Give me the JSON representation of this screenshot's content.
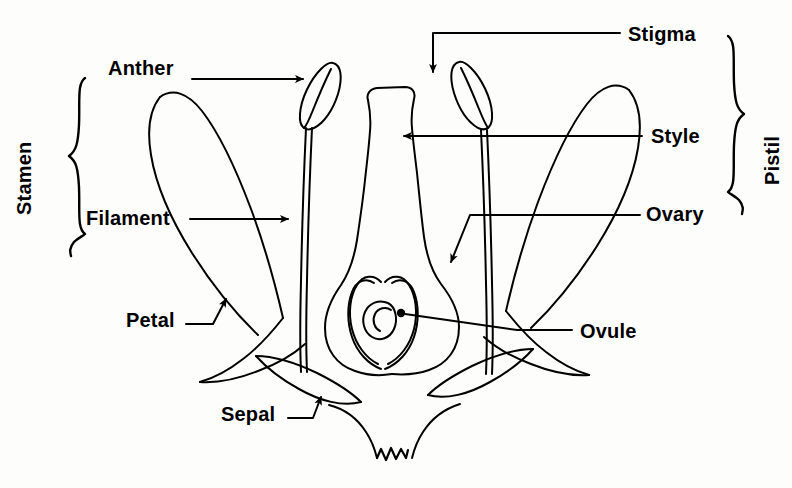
{
  "figure": {
    "kind": "botanical-diagram",
    "background_color": "#fdfdfc",
    "ink_color": "#000000",
    "width": 792,
    "height": 488
  },
  "labels": {
    "stamen": "Stamen",
    "pistil": "Pistil",
    "anther": "Anther",
    "filament": "Filament",
    "petal": "Petal",
    "sepal": "Sepal",
    "stigma": "Stigma",
    "style": "Style",
    "ovary": "Ovary",
    "ovule": "Ovule"
  },
  "groups": [
    {
      "name": "Stamen",
      "side": "left",
      "parts": [
        "Anther",
        "Filament"
      ]
    },
    {
      "name": "Pistil",
      "side": "right",
      "parts": [
        "Stigma",
        "Style",
        "Ovary"
      ]
    }
  ],
  "callouts": [
    {
      "label": "Anther",
      "side": "left",
      "leader": "straight-arrow",
      "points_to": "anther-left"
    },
    {
      "label": "Filament",
      "side": "left",
      "leader": "straight-arrow",
      "points_to": "filament-left"
    },
    {
      "label": "Petal",
      "side": "left",
      "leader": "elbow-arrow",
      "points_to": "petal-left"
    },
    {
      "label": "Sepal",
      "side": "left",
      "leader": "elbow-arrow",
      "points_to": "sepal-left"
    },
    {
      "label": "Stigma",
      "side": "right",
      "leader": "elbow-arrow",
      "points_to": "stigma"
    },
    {
      "label": "Style",
      "side": "right",
      "leader": "straight-arrow",
      "points_to": "style"
    },
    {
      "label": "Ovary",
      "side": "right",
      "leader": "elbow-arrow",
      "points_to": "ovary-wall"
    },
    {
      "label": "Ovule",
      "side": "right",
      "leader": "plain-line",
      "points_to": "ovule"
    }
  ]
}
